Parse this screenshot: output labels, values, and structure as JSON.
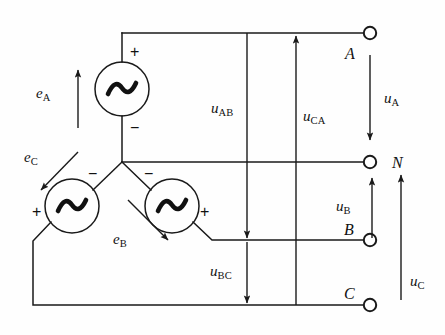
{
  "figure": {
    "type": "three-phase-star-connected-source-circuit-diagram",
    "background_color": "#fefefe",
    "line_color": "#1a1a1a"
  },
  "sources": [
    {
      "id": "source-a",
      "label": "e",
      "subscript": "A",
      "symbol": "sine-wave",
      "plus": "+",
      "minus": "−",
      "arrow_direction": "up"
    },
    {
      "id": "source-c",
      "label": "e",
      "subscript": "C",
      "symbol": "sine-wave",
      "plus": "+",
      "minus": "−",
      "arrow_direction": "down-left"
    },
    {
      "id": "source-b",
      "label": "e",
      "subscript": "B",
      "symbol": "sine-wave",
      "plus": "+",
      "minus": "−",
      "arrow_direction": "down-right"
    }
  ],
  "terminals": [
    {
      "id": "terminal-a",
      "label": "A"
    },
    {
      "id": "terminal-n",
      "label": "N"
    },
    {
      "id": "terminal-b",
      "label": "B"
    },
    {
      "id": "terminal-c",
      "label": "C"
    }
  ],
  "voltages": {
    "line_to_line": [
      {
        "id": "u-ab",
        "label": "u",
        "subscript": "AB",
        "arrow_direction": "down",
        "from": "A",
        "to": "B"
      },
      {
        "id": "u-bc",
        "label": "u",
        "subscript": "BC",
        "arrow_direction": "down",
        "from": "B",
        "to": "C"
      },
      {
        "id": "u-ca",
        "label": "u",
        "subscript": "CA",
        "arrow_direction": "up",
        "from": "C",
        "to": "A"
      }
    ],
    "phase": [
      {
        "id": "u-a",
        "label": "u",
        "subscript": "A",
        "arrow_direction": "down",
        "from": "A",
        "to": "N"
      },
      {
        "id": "u-b",
        "label": "u",
        "subscript": "B",
        "arrow_direction": "up",
        "from": "B",
        "to": "N"
      },
      {
        "id": "u-c",
        "label": "u",
        "subscript": "C",
        "arrow_direction": "up",
        "from": "C",
        "to": "N"
      }
    ]
  },
  "signs": {
    "source_a_plus": "+",
    "source_a_minus": "−",
    "source_c_plus": "+",
    "source_c_minus": "−",
    "source_b_plus": "+",
    "source_b_minus": "−"
  }
}
